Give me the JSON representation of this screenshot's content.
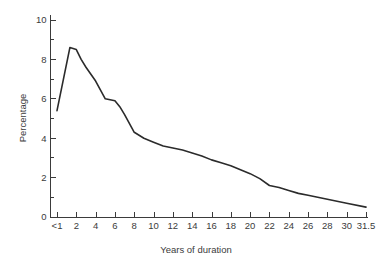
{
  "chart_data": {
    "type": "line",
    "title": "",
    "xlabel": "Years of duration",
    "ylabel": "Percentage",
    "xlim": [
      0,
      17
    ],
    "ylim": [
      0,
      10
    ],
    "grid": false,
    "legend": null,
    "line_color": "#2b2b2b",
    "axis_color": "#3b3b3b",
    "x_tick_labels": [
      "<1",
      "2",
      "4",
      "6",
      "8",
      "10",
      "12",
      "14",
      "16",
      "18",
      "20",
      "22",
      "24",
      "26",
      "28",
      "30",
      "31.5"
    ],
    "y_tick_labels": [
      "0",
      "2",
      "4",
      "6",
      "8",
      "10"
    ],
    "y_major_ticks": [
      0,
      2,
      4,
      6,
      8,
      10
    ],
    "y_minor_ticks": [
      1,
      3,
      5,
      7,
      9
    ],
    "x": [
      0.5,
      1,
      1.5,
      2,
      2.5,
      3,
      4,
      5,
      5.5,
      6,
      6.5,
      7,
      8,
      9,
      10,
      11,
      12,
      13,
      14,
      15,
      16,
      17,
      18,
      19,
      20,
      21,
      22,
      23,
      24,
      25,
      26,
      27,
      28,
      29,
      30,
      31.5
    ],
    "values": [
      5.4,
      7.0,
      8.6,
      8.5,
      8.0,
      7.6,
      6.9,
      6.0,
      5.95,
      5.9,
      5.6,
      5.2,
      4.3,
      4.0,
      3.8,
      3.6,
      3.5,
      3.4,
      3.25,
      3.1,
      2.9,
      2.75,
      2.6,
      2.4,
      2.2,
      1.95,
      1.6,
      1.5,
      1.35,
      1.2,
      1.1,
      1.0,
      0.9,
      0.8,
      0.7,
      0.5
    ]
  }
}
